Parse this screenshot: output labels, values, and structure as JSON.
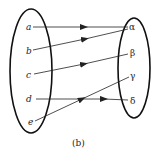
{
  "diagram": {
    "type": "function-mapping",
    "caption": "(b)",
    "domain_set": {
      "elements": [
        {
          "label": "a",
          "x": 28,
          "y": 28
        },
        {
          "label": "b",
          "x": 28,
          "y": 52
        },
        {
          "label": "c",
          "x": 28,
          "y": 75
        },
        {
          "label": "d",
          "x": 28,
          "y": 99
        },
        {
          "label": "e",
          "x": 30,
          "y": 122
        }
      ]
    },
    "codomain_set": {
      "elements": [
        {
          "label": "α",
          "x": 131,
          "y": 28
        },
        {
          "label": "β",
          "x": 131,
          "y": 53
        },
        {
          "label": "γ",
          "x": 131,
          "y": 76
        },
        {
          "label": "δ",
          "x": 131,
          "y": 101
        }
      ]
    },
    "mappings": [
      {
        "from": "a",
        "to": "α"
      },
      {
        "from": "b",
        "to": "α"
      },
      {
        "from": "c",
        "to": "β"
      },
      {
        "from": "d",
        "to": "δ"
      },
      {
        "from": "e",
        "to": "γ"
      }
    ]
  }
}
